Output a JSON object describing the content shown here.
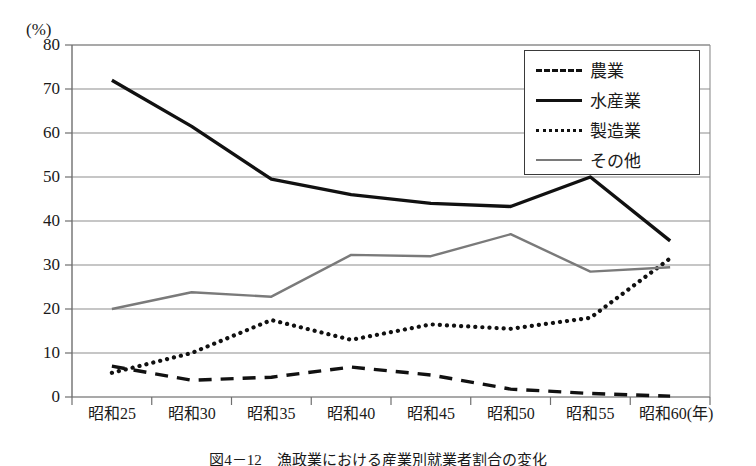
{
  "chart_data": {
    "type": "line",
    "title": "",
    "xlabel": "(年)",
    "ylabel": "(%)",
    "ylim": [
      0,
      80
    ],
    "yticks": [
      0,
      10,
      20,
      30,
      40,
      50,
      60,
      70,
      80
    ],
    "grid": true,
    "legend_position": "top-right",
    "categories": [
      "昭和25",
      "昭和30",
      "昭和35",
      "昭和40",
      "昭和45",
      "昭和50",
      "昭和55",
      "昭和60"
    ],
    "series": [
      {
        "name": "農業",
        "style": "dashed",
        "color": "#111111",
        "values": [
          7.0,
          3.8,
          4.5,
          6.8,
          5.0,
          1.8,
          0.8,
          0.2
        ]
      },
      {
        "name": "水産業",
        "style": "solid",
        "color": "#111111",
        "values": [
          72.0,
          61.5,
          49.5,
          46.0,
          44.0,
          43.3,
          50.0,
          35.5
        ]
      },
      {
        "name": "製造業",
        "style": "dotted",
        "color": "#111111",
        "values": [
          5.5,
          10.0,
          17.5,
          13.0,
          16.5,
          15.5,
          18.0,
          31.5
        ]
      },
      {
        "name": "その他",
        "style": "solid",
        "color": "#7a7a7a",
        "values": [
          20.0,
          23.8,
          22.8,
          32.3,
          32.0,
          37.0,
          28.5,
          29.5
        ]
      }
    ]
  },
  "axis": {
    "unit_label": "(%)",
    "x_unit_suffix": "(年)",
    "ytick_labels": [
      "80",
      "70",
      "60",
      "50",
      "40",
      "30",
      "20",
      "10",
      "0"
    ]
  },
  "legend": {
    "items": [
      {
        "label": "農業"
      },
      {
        "label": "水産業"
      },
      {
        "label": "製造業"
      },
      {
        "label": "その他"
      }
    ]
  },
  "caption": {
    "text": "図4－12　漁政業における産業別就業者割合の変化"
  }
}
